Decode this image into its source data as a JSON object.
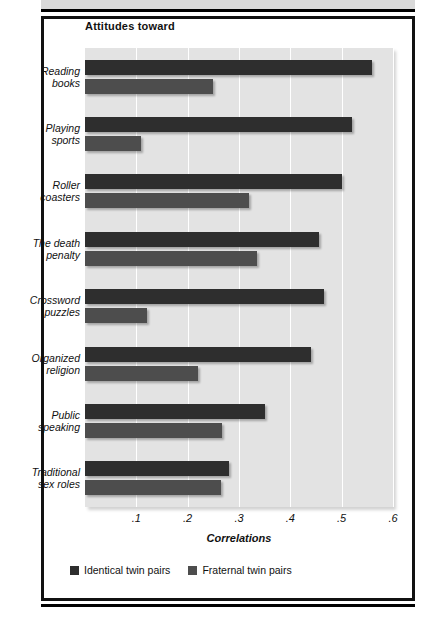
{
  "chart_data": {
    "type": "bar",
    "orientation": "horizontal",
    "title": "Attitudes toward",
    "xlabel": "Correlations",
    "ylabel": "",
    "xlim": [
      0,
      0.6
    ],
    "xticks": [
      ".1",
      ".2",
      ".3",
      ".4",
      ".5",
      ".6"
    ],
    "xtick_values": [
      0.1,
      0.2,
      0.3,
      0.4,
      0.5,
      0.6
    ],
    "grid": true,
    "legend_position": "bottom-left",
    "categories": [
      "Reading books",
      "Playing sports",
      "Roller coasters",
      "The death penalty",
      "Crossword puzzles",
      "Organized religion",
      "Public speaking",
      "Traditional sex roles"
    ],
    "category_lines": [
      [
        "Reading",
        "books"
      ],
      [
        "Playing",
        "sports"
      ],
      [
        "Roller",
        "coasters"
      ],
      [
        "The death",
        "penalty"
      ],
      [
        "Crossword",
        "puzzles"
      ],
      [
        "Organized",
        "religion"
      ],
      [
        "Public",
        "speaking"
      ],
      [
        "Traditional",
        "sex roles"
      ]
    ],
    "series": [
      {
        "name": "Identical twin pairs",
        "color": "#2e2e2e",
        "values": [
          0.56,
          0.52,
          0.5,
          0.455,
          0.465,
          0.44,
          0.35,
          0.28
        ]
      },
      {
        "name": "Fraternal twin pairs",
        "color": "#4d4d4d",
        "values": [
          0.25,
          0.11,
          0.32,
          0.335,
          0.12,
          0.22,
          0.267,
          0.265
        ]
      }
    ]
  },
  "legend": {
    "items": [
      {
        "label": "Identical twin pairs"
      },
      {
        "label": "Fraternal twin pairs"
      }
    ]
  },
  "colors": {
    "identical": "#2e2e2e",
    "fraternal": "#4d4d4d",
    "plot_background": "#e3e3e3",
    "gridline": "#ffffff",
    "frame": "#111111"
  }
}
